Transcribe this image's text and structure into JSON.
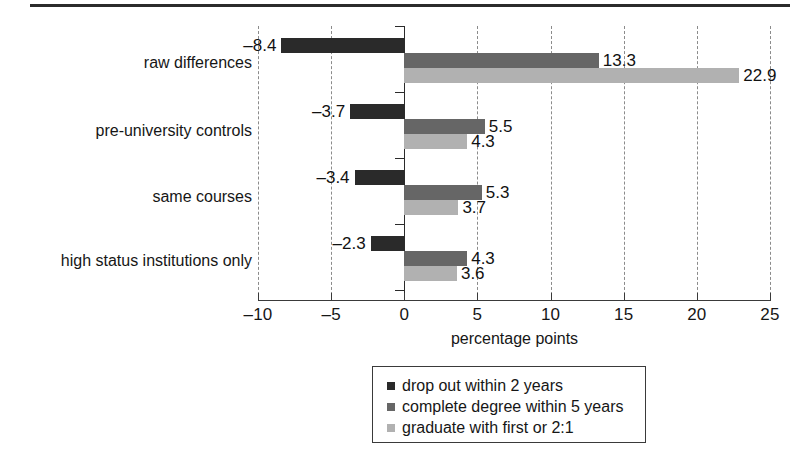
{
  "chart_data": {
    "type": "bar",
    "orientation": "horizontal",
    "title": "",
    "xlabel": "percentage points",
    "ylabel": "",
    "xlim": [
      -10,
      25
    ],
    "xticks": [
      -10,
      -5,
      0,
      5,
      10,
      15,
      20,
      25
    ],
    "xtick_labels": [
      "–10",
      "–5",
      "0",
      "5",
      "10",
      "15",
      "20",
      "25"
    ],
    "grid": true,
    "grid_axis": "x",
    "grid_style": "dashed",
    "legend_position": "below-center",
    "categories": [
      "raw differences",
      "pre-university controls",
      "same courses",
      "high status institutions only"
    ],
    "series": [
      {
        "name": "drop out within 2 years",
        "color": "#2a2a2a",
        "values": [
          -8.4,
          -3.7,
          -3.4,
          -2.3
        ],
        "labels": [
          "–8.4",
          "–3.7",
          "–3.4",
          "–2.3"
        ]
      },
      {
        "name": "complete degree within 5 years",
        "color": "#666666",
        "values": [
          13.3,
          5.5,
          5.3,
          4.3
        ],
        "labels": [
          "13.3",
          "5.5",
          "5.3",
          "4.3"
        ]
      },
      {
        "name": "graduate with first or 2:1",
        "color": "#b1b1b1",
        "values": [
          22.9,
          4.3,
          3.7,
          3.6
        ],
        "labels": [
          "22.9",
          "4.3",
          "3.7",
          "3.6"
        ]
      }
    ]
  },
  "legend": {
    "items": [
      {
        "label": "drop out within 2 years",
        "color": "#2a2a2a"
      },
      {
        "label": "complete degree within 5 years",
        "color": "#666666"
      },
      {
        "label": "graduate with first or 2:1",
        "color": "#b1b1b1"
      }
    ]
  }
}
